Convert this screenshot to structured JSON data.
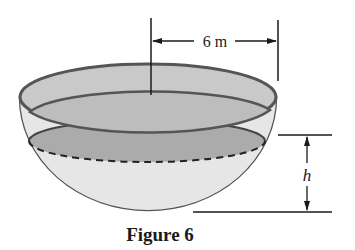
{
  "figure": {
    "caption": "Figure 6",
    "radius_label": "6 m",
    "height_label": "h",
    "colors": {
      "bowl_fill": "#d9d9d9",
      "rim_fill": "#c8c8c8",
      "water_surface": "#a9a9a9",
      "outline": "#555555",
      "ink": "#1a1a1a"
    }
  }
}
